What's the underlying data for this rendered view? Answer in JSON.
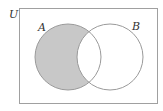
{
  "diagram": {
    "type": "venn",
    "universe_label": "U",
    "sets": [
      {
        "label": "A",
        "cx": 68,
        "cy": 57,
        "r": 33
      },
      {
        "label": "B",
        "cx": 110,
        "cy": 57,
        "r": 33
      }
    ],
    "shaded_region": "A minus B",
    "colors": {
      "shade": "#c8c8c8",
      "stroke": "#9a9a9a",
      "text": "#333333",
      "background": "#ffffff"
    }
  }
}
